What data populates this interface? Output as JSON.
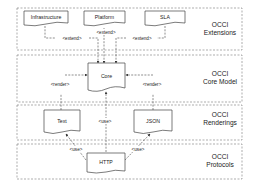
{
  "layers": [
    {
      "line1": "OCCI",
      "line2": "Extensions"
    },
    {
      "line1": "OCCI",
      "line2": "Core Model"
    },
    {
      "line1": "OCCI",
      "line2": "Renderings"
    },
    {
      "line1": "OCCI",
      "line2": "Protocols"
    }
  ],
  "nodes": {
    "infrastructure": "Infrastructure",
    "platform": "Platform",
    "sla": "SLA",
    "core": "Core",
    "text": "Text",
    "json": "JSON",
    "http": "HTTP"
  },
  "relations": {
    "extend_left": "<extend>",
    "extend_mid": "<extend>",
    "extend_right": "<extend>",
    "render_left": "<render>",
    "render_right": "<render>",
    "use_mid": "<use>",
    "use_left": "<use>",
    "use_right": "<use>"
  },
  "colors": {
    "stroke": "#555555",
    "text": "#222222",
    "background": "#ffffff"
  }
}
